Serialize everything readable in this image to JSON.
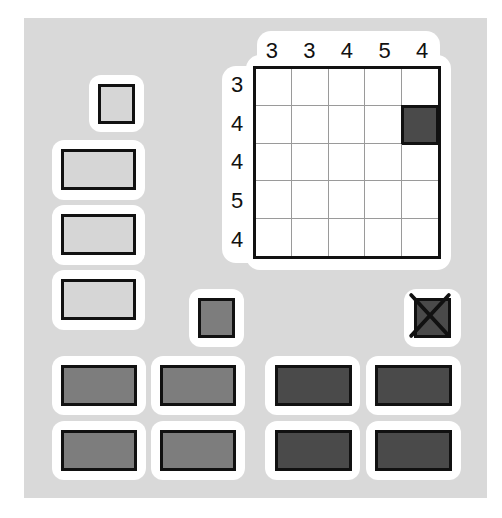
{
  "game": {
    "type": "nonogram-like block puzzle",
    "colors": {
      "panel_bg": "#d9d9d9",
      "card_bg": "#ffffff",
      "light_piece": "#d6d6d6",
      "mid_piece": "#7d7d7d",
      "dark_piece": "#4a4a4a",
      "outline": "#111111"
    }
  },
  "board": {
    "rows": 5,
    "cols": 5,
    "column_clues": [
      "3",
      "3",
      "4",
      "5",
      "4"
    ],
    "row_clues": [
      "3",
      "4",
      "4",
      "5",
      "4"
    ],
    "filled_cells": [
      [
        1,
        4
      ]
    ]
  },
  "pieces": {
    "light_left_column": [
      {
        "shape": "square",
        "shade": "light"
      },
      {
        "shape": "rectangle",
        "shade": "light"
      },
      {
        "shape": "rectangle",
        "shade": "light"
      },
      {
        "shape": "rectangle",
        "shade": "light"
      }
    ],
    "mid_square": {
      "shape": "square",
      "shade": "mid"
    },
    "dark_square_crossed": {
      "shape": "square",
      "shade": "dark",
      "icon": "x-mark-icon"
    },
    "bottom_grid": [
      {
        "shape": "rectangle",
        "shade": "mid"
      },
      {
        "shape": "rectangle",
        "shade": "mid"
      },
      {
        "shape": "rectangle",
        "shade": "dark"
      },
      {
        "shape": "rectangle",
        "shade": "dark"
      },
      {
        "shape": "rectangle",
        "shade": "mid"
      },
      {
        "shape": "rectangle",
        "shade": "mid"
      },
      {
        "shape": "rectangle",
        "shade": "dark"
      },
      {
        "shape": "rectangle",
        "shade": "dark"
      }
    ]
  }
}
